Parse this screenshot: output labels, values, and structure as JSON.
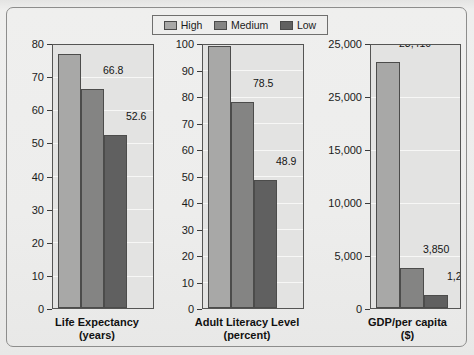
{
  "legend": {
    "items": [
      {
        "label": "High",
        "color": "#a8a8a7"
      },
      {
        "label": "Medium",
        "color": "#848483"
      },
      {
        "label": "Low",
        "color": "#606060"
      }
    ]
  },
  "chart_data": {
    "type": "bar",
    "title": "",
    "legend_position": "top-center",
    "grid": true,
    "series": [
      {
        "name": "High",
        "color": "#a8a8a7"
      },
      {
        "name": "Medium",
        "color": "#848483"
      },
      {
        "name": "Low",
        "color": "#606060"
      }
    ],
    "panels": [
      {
        "xlabel": "Life Expectancy",
        "xlabel_sub": "(years)",
        "ylabel": "",
        "ylim": [
          0,
          80
        ],
        "yticks": [
          0,
          10,
          20,
          30,
          40,
          50,
          60,
          70,
          80
        ],
        "yticklabels": [
          "0",
          "10",
          "20",
          "30",
          "40",
          "50",
          "60",
          "70",
          "80"
        ],
        "categories": [
          "High",
          "Medium",
          "Low"
        ],
        "values": [
          77.3,
          66.8,
          52.6
        ],
        "datalabels": [
          "77.3",
          "66.8",
          "52.6"
        ]
      },
      {
        "xlabel": "Adult Literacy Level",
        "xlabel_sub": "(percent)",
        "ylabel": "",
        "ylim": [
          0,
          100
        ],
        "yticks": [
          0,
          10,
          20,
          30,
          40,
          50,
          60,
          70,
          80,
          90,
          100
        ],
        "yticklabels": [
          "0",
          "10",
          "20",
          "30",
          "40",
          "50",
          "60",
          "70",
          "80",
          "90",
          "100"
        ],
        "categories": [
          "High",
          "Medium",
          "Low"
        ],
        "values": [
          99.9,
          78.5,
          48.9
        ],
        "datalabels": [
          "99.9",
          "78.5",
          "48.9"
        ]
      },
      {
        "xlabel": "GDP/per capita",
        "xlabel_sub": "($)",
        "ylabel": "",
        "ylim": [
          0,
          25000
        ],
        "yticks": [
          0,
          5000,
          10000,
          15000,
          20000,
          25000
        ],
        "yticklabels": [
          "0",
          "5,000",
          "10,000",
          "15,000",
          "25,000",
          "25,000"
        ],
        "categories": [
          "High",
          "Medium",
          "Low"
        ],
        "values": [
          23410,
          3850,
          1200
        ],
        "datalabels": [
          "23,410",
          "3,850",
          "1,200"
        ]
      }
    ]
  }
}
